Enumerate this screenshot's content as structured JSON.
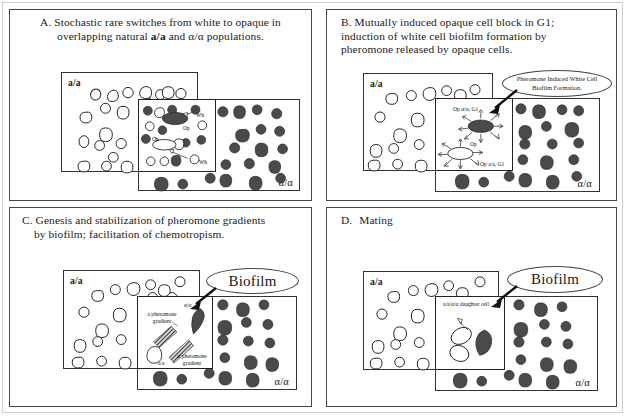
{
  "figure": {
    "caption_letters": [
      "A.",
      "B.",
      "C.",
      "D."
    ],
    "mating_type_a": "a/a",
    "mating_type_alpha": "α/α"
  },
  "panels": [
    {
      "id": "A",
      "letter": "A.",
      "title_line1": "Stochastic rare switches from white to opaque in",
      "title_line2_pre": "overlapping natural ",
      "title_line2_a": "a/a",
      "title_line2_mid": " and ",
      "title_line2_alpha": "α/α",
      "title_line2_post": " populations.",
      "box_a_label": "a/a",
      "box_alpha_label": "α/α",
      "annotations": [
        {
          "name": "white-cell-upper",
          "text": "Wh"
        },
        {
          "name": "opaque-cell-upper",
          "text": "Op"
        },
        {
          "name": "opaque-cell-lower",
          "text": "Op"
        },
        {
          "name": "white-cell-lower",
          "text": "Wh"
        }
      ]
    },
    {
      "id": "B",
      "letter": "B.",
      "title_line1": "Mutually induced opaque cell block in G1;",
      "title_line2": "induction of white cell biofilm formation by",
      "title_line3": "pheromone released by opaque cells.",
      "box_a_label": "a/a",
      "box_alpha_label": "α/α",
      "callout": "Pheromone Induced White Cell Biofilm Formation.",
      "annotations": [
        {
          "name": "opaque-alpha-g1",
          "text": "Op α/α, G1"
        },
        {
          "name": "opaque-center",
          "text": "Op"
        },
        {
          "name": "opaque-a-g1",
          "text": "Op a/a, G1"
        }
      ]
    },
    {
      "id": "C",
      "letter": "C.",
      "title_line1": "Genesis and stabilization of pheromone gradients",
      "title_line2": "by biofilm;  facilitation of chemotropism.",
      "box_a_label": "a/a",
      "box_alpha_label": "α/α",
      "callout": "Biofilm",
      "annotations": [
        {
          "name": "a-pheromone-gradient",
          "text": "a pheromone gradient"
        },
        {
          "name": "alpha-pheromone-gradient",
          "text": "α pheromone gradient"
        },
        {
          "name": "alpha-cell-tag",
          "text": "α/α"
        },
        {
          "name": "a-cell-tag",
          "text": "a/a"
        }
      ]
    },
    {
      "id": "D",
      "letter": "D.",
      "title_line1": "Mating",
      "box_a_label": "a/a",
      "box_alpha_label": "α/α",
      "callout": "Biofilm",
      "annotations": [
        {
          "name": "daughter-cell-label",
          "text": "a/a/α/α daughter cell"
        }
      ]
    }
  ],
  "colors": {
    "opaque_cell_fill": "#4a4a4a",
    "white_cell_fill": "#ffffff",
    "outline": "#222222",
    "panel_border": "#4a4a4a"
  }
}
